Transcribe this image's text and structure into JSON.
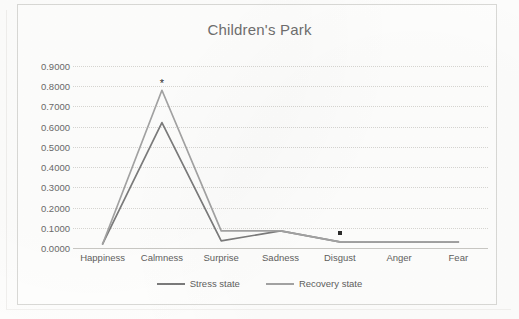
{
  "chart_data": {
    "type": "line",
    "title": "Children's Park",
    "xlabel": "",
    "ylabel": "",
    "categories": [
      "Happiness",
      "Calmness",
      "Surprise",
      "Sadness",
      "Disgust",
      "Anger",
      "Fear"
    ],
    "ylim": [
      0.0,
      0.9
    ],
    "ytick_labels": [
      "0.9000",
      "0.8000",
      "0.7000",
      "0.6000",
      "0.5000",
      "0.4000",
      "0.3000",
      "0.2000",
      "0.1000",
      "0.0000"
    ],
    "ytick_values": [
      0.9,
      0.8,
      0.7,
      0.6,
      0.5,
      0.4,
      0.3,
      0.2,
      0.1,
      0.0
    ],
    "grid": true,
    "legend_position": "bottom",
    "series": [
      {
        "name": "Stress state",
        "color": "#7b7b7b",
        "values": [
          0.02,
          0.62,
          0.035,
          0.085,
          0.03,
          0.03,
          0.03
        ]
      },
      {
        "name": "Recovery state",
        "color": "#a3a3a3",
        "values": [
          0.02,
          0.78,
          0.085,
          0.085,
          0.03,
          0.03,
          0.03
        ]
      }
    ],
    "annotations": [
      {
        "symbol": "*",
        "shape": "star",
        "category": "Calmness",
        "value": 0.815
      },
      {
        "symbol": "■",
        "shape": "square",
        "category": "Disgust",
        "value": 0.075
      }
    ]
  }
}
